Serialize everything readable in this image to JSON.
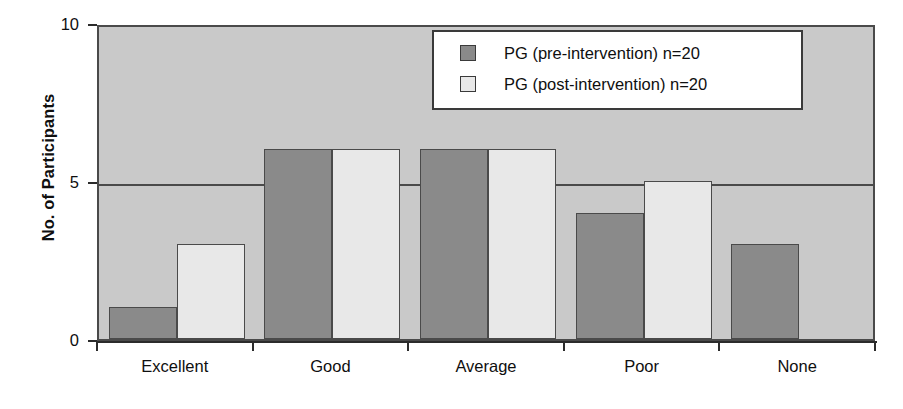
{
  "chart_data": {
    "type": "bar",
    "title": "",
    "xlabel": "",
    "ylabel": "No. of Participants",
    "ylim": [
      0,
      10
    ],
    "yticks": [
      0,
      5,
      10
    ],
    "ytick_labels": [
      "0",
      "5",
      "10"
    ],
    "grid": true,
    "legend_position": "top-right",
    "categories": [
      "Excellent",
      "Good",
      "Average",
      "Poor",
      "None"
    ],
    "series": [
      {
        "name": "PG (pre-intervention) n=20",
        "key": "pre",
        "color": "#8a8a8a",
        "values": [
          1,
          6,
          6,
          4,
          3
        ]
      },
      {
        "name": "PG (post-intervention) n=20",
        "key": "post",
        "color": "#e8e8e8",
        "values": [
          3,
          6,
          6,
          5,
          0
        ]
      }
    ]
  },
  "colors": {
    "plot_background": "#c9c9c9",
    "axis": "#2b2b2b",
    "bar_border": "#4a4a4a",
    "legend_background": "#ffffff",
    "legend_border": "#3a3a3a",
    "text": "#0f0f0f"
  }
}
